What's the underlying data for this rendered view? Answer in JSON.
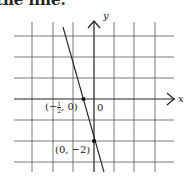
{
  "top_text": "the line.",
  "figure": {
    "axes": {
      "x_label": "x",
      "y_label": "y",
      "origin_label": "0"
    },
    "grid": {
      "x_range": [
        -4,
        3
      ],
      "y_range": [
        -3,
        3
      ],
      "spacing": 1
    },
    "line": {
      "equation": "y = -4x - 2",
      "slope": -4,
      "y_intercept": -2
    },
    "points": [
      {
        "label_prefix": "(−",
        "label_num": "1",
        "label_den": "2",
        "label_suffix": ", 0)",
        "x": -0.5,
        "y": 0
      },
      {
        "label": "(0, −2)",
        "x": 0,
        "y": -2
      }
    ]
  }
}
